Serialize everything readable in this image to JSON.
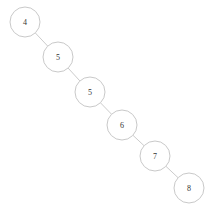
{
  "diagram": {
    "kind": "binary-search-tree",
    "shape": "right-skewed-chain",
    "width": 213,
    "height": 210,
    "background_color": "#ffffff",
    "node_radius": 15,
    "node_fill_color": "#ffffff",
    "node_stroke_color": "#c9c9c9",
    "edge_stroke_color": "#cccccc",
    "label_color": "#333333",
    "nodes": [
      {
        "id": "n0",
        "label": "4",
        "cx": 25,
        "cy": 22
      },
      {
        "id": "n1",
        "label": "5",
        "cx": 58,
        "cy": 57
      },
      {
        "id": "n2",
        "label": "5",
        "cx": 90,
        "cy": 92
      },
      {
        "id": "n3",
        "label": "6",
        "cx": 122,
        "cy": 125
      },
      {
        "id": "n4",
        "label": "7",
        "cx": 155,
        "cy": 156
      },
      {
        "id": "n5",
        "label": "8",
        "cx": 189,
        "cy": 188
      }
    ],
    "edges": [
      {
        "id": "e0",
        "from": "n0",
        "to": "n1"
      },
      {
        "id": "e1",
        "from": "n1",
        "to": "n2"
      },
      {
        "id": "e2",
        "from": "n2",
        "to": "n3"
      },
      {
        "id": "e3",
        "from": "n3",
        "to": "n4"
      },
      {
        "id": "e4",
        "from": "n4",
        "to": "n5"
      }
    ]
  }
}
